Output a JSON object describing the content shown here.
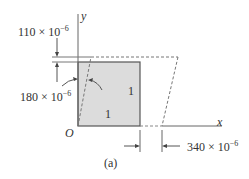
{
  "figure": {
    "caption": "(a)",
    "axes": {
      "x_label": "x",
      "y_label": "y",
      "origin_label": "O"
    },
    "element": {
      "shaded_square_labels": [
        "1",
        "1"
      ],
      "fill_color": "#d9d9d9",
      "line_color": "#555555"
    },
    "dimensions": {
      "top_offset": {
        "base": "110 × 10",
        "exp": "−6"
      },
      "left_angle": {
        "base": "180 × 10",
        "exp": "−6"
      },
      "bottom_offset": {
        "base": "340 × 10",
        "exp": "−6"
      }
    }
  }
}
